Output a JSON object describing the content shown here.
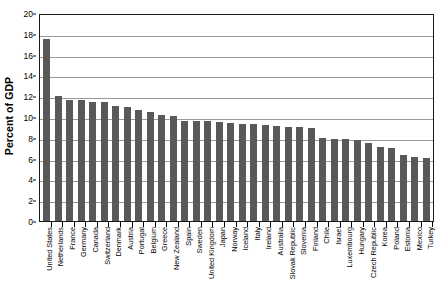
{
  "chart_data": {
    "type": "bar",
    "title": "",
    "xlabel": "",
    "ylabel": "Percent of GDP",
    "ylim": [
      0,
      20
    ],
    "ytick_step": 2,
    "yticks": [
      "20",
      "18",
      "16",
      "14",
      "12",
      "10",
      "8",
      "6",
      "4",
      "2",
      "0"
    ],
    "grid": true,
    "legend": "none",
    "bar_color": "#595959",
    "plot_border_color": "#1a1a1a",
    "gridline_color": "#9a9a9a",
    "categories": [
      "United States",
      "Netherlands",
      "France",
      "Germany",
      "Canada",
      "Switzerland",
      "Denmark",
      "Austria",
      "Portugal",
      "Belgium",
      "Greece",
      "New Zealand",
      "Spain",
      "Sweden",
      "United Kingdom",
      "Japan",
      "Norway",
      "Iceland",
      "Italy",
      "Ireland",
      "Australia",
      "Slovak Republic",
      "Slovenia",
      "Finland",
      "Chile",
      "Israel",
      "Luxembourg",
      "Hungary",
      "Czech Republic",
      "Korea",
      "Poland",
      "Estonia",
      "Mexico",
      "Turkey"
    ],
    "values": [
      17.5,
      12.0,
      11.6,
      11.6,
      11.4,
      11.4,
      11.1,
      11.0,
      10.7,
      10.5,
      10.2,
      10.1,
      9.6,
      9.6,
      9.6,
      9.5,
      9.4,
      9.3,
      9.3,
      9.2,
      9.1,
      9.0,
      9.0,
      8.9,
      8.0,
      7.9,
      7.9,
      7.8,
      7.5,
      7.1,
      7.0,
      6.3,
      6.2,
      6.1
    ]
  }
}
